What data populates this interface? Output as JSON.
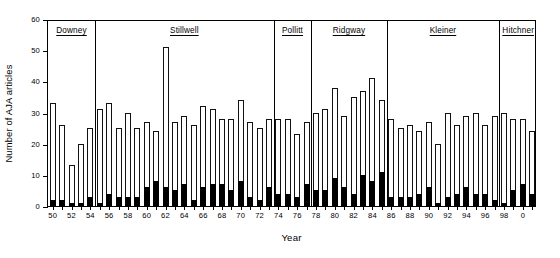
{
  "chart_data": {
    "type": "bar",
    "title": "",
    "xlabel": "Year",
    "ylabel": "Number of AJA articles",
    "ylim": [
      0,
      60
    ],
    "yticks": [
      0,
      10,
      20,
      30,
      40,
      50,
      60
    ],
    "grid": false,
    "legend": null,
    "stacked": true,
    "categories": [
      "1950",
      "1951",
      "1952",
      "1953",
      "1954",
      "1955",
      "1956",
      "1957",
      "1958",
      "1959",
      "1960",
      "1961",
      "1962",
      "1963",
      "1964",
      "1965",
      "1966",
      "1967",
      "1968",
      "1969",
      "1970",
      "1971",
      "1972",
      "1973",
      "1974",
      "1975",
      "1976",
      "1977",
      "1978",
      "1979",
      "1980",
      "1981",
      "1982",
      "1983",
      "1984",
      "1985",
      "1986",
      "1987",
      "1988",
      "1989",
      "1990",
      "1991",
      "1992",
      "1993",
      "1994",
      "1995",
      "1996",
      "1997",
      "1998",
      "1999",
      "2000",
      "2001"
    ],
    "tick_labels": [
      "50",
      "",
      "52",
      "",
      "54",
      "",
      "56",
      "",
      "58",
      "",
      "60",
      "",
      "62",
      "",
      "64",
      "",
      "66",
      "",
      "68",
      "",
      "70",
      "",
      "72",
      "",
      "74",
      "",
      "76",
      "",
      "78",
      "",
      "80",
      "",
      "82",
      "",
      "84",
      "",
      "86",
      "",
      "88",
      "",
      "90",
      "",
      "92",
      "",
      "94",
      "",
      "96",
      "",
      "98",
      "",
      "0",
      "",
      "1"
    ],
    "series": [
      {
        "name": "Total AJA articles",
        "color": "#ffffff",
        "values": [
          33,
          26,
          13,
          20,
          25,
          31,
          33,
          25,
          30,
          25,
          27,
          24,
          51,
          27,
          29,
          26,
          32,
          31,
          28,
          28,
          34,
          27,
          25,
          28,
          28,
          28,
          23,
          27,
          30,
          31,
          38,
          29,
          35,
          37,
          41,
          34,
          28,
          25,
          26,
          24,
          27,
          20,
          30,
          26,
          29,
          30,
          26,
          29,
          30,
          28,
          28,
          24
        ]
      },
      {
        "name": "AJA articles (subset, solid black)",
        "color": "#000000",
        "values": [
          2,
          2,
          1,
          1,
          3,
          1,
          4,
          3,
          3,
          3,
          6,
          8,
          6,
          5,
          7,
          2,
          6,
          7,
          7,
          5,
          8,
          3,
          2,
          6,
          4,
          4,
          3,
          7,
          5,
          5,
          9,
          6,
          4,
          10,
          8,
          11,
          3,
          3,
          3,
          4,
          6,
          1,
          3,
          4,
          6,
          4,
          4,
          2,
          1,
          5,
          7,
          4
        ]
      }
    ],
    "annotations": {
      "editors": [
        {
          "name": "Downey",
          "start_year": 1950,
          "end_year": 1954
        },
        {
          "name": "Stillwell",
          "start_year": 1955,
          "end_year": 1973
        },
        {
          "name": "Pollitt",
          "start_year": 1974,
          "end_year": 1977
        },
        {
          "name": "Ridgway",
          "start_year": 1978,
          "end_year": 1985
        },
        {
          "name": "Kleiner",
          "start_year": 1986,
          "end_year": 1997
        },
        {
          "name": "Hitchner",
          "start_year": 1998,
          "end_year": 2001
        }
      ]
    }
  }
}
